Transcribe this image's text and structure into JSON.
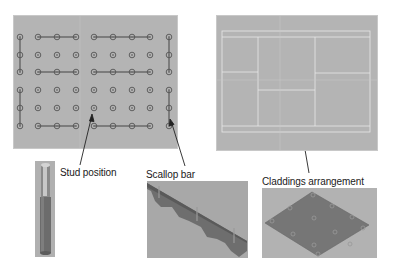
{
  "labels": {
    "stud_position": "Stud position",
    "scallop_bar": "Scallop bar",
    "claddings_arrangement": "Claddings arrangement"
  },
  "colors": {
    "panel_bg": "#b4b4b4",
    "grid_circle": "#555555",
    "grid_line": "#444444",
    "layout_line": "#e6e6e6",
    "render_bg": "#a9a9a9",
    "render_part": "#6e6e6e"
  },
  "stud_grid": {
    "columns_x": [
      20,
      38,
      57,
      76,
      94,
      113,
      132,
      150,
      169
    ],
    "rows_y": [
      37,
      55,
      72,
      90,
      108,
      126
    ]
  },
  "icons": {
    "stud_render": "stud-3d-render",
    "scallop_render": "scallop-bar-3d-render",
    "cladding_render": "cladding-plate-3d-render",
    "arrow": "pointer-arrow"
  }
}
